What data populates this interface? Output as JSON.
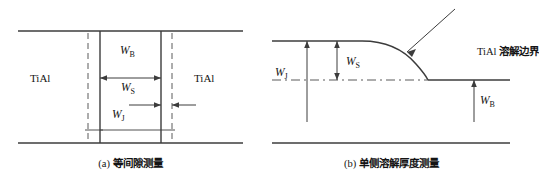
{
  "figure": {
    "panel_a": {
      "caption_prefix": "(a)",
      "caption_cjk": "等间隙测量",
      "material_left": "TiAl",
      "material_right": "TiAl",
      "dim_b": "W",
      "dim_b_sub": "B",
      "dim_s": "W",
      "dim_s_sub": "S",
      "dim_j": "W",
      "dim_j_sub": "J"
    },
    "panel_b": {
      "caption_prefix": "(b)",
      "caption_cjk": "单侧溶解厚度测量",
      "boundary_prefix": "TiAl",
      "boundary_cjk": "溶解边界",
      "dim_s": "W",
      "dim_s_sub": "S",
      "dim_j": "W",
      "dim_j_sub": "J",
      "dim_b": "W",
      "dim_b_sub": "B"
    },
    "colors": {
      "line": "#3c3c3c",
      "dashed": "#5a5a5a",
      "text": "#141414"
    }
  }
}
